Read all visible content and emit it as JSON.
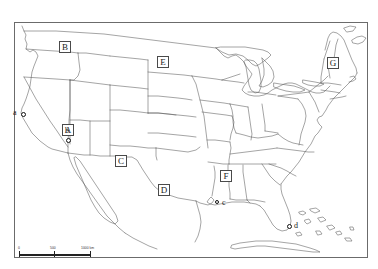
{
  "map": {
    "title": "Blank map of the contiguous United States",
    "projection_note": "United States political outline map with state boundaries",
    "background_color": "#ffffff",
    "outline_color": "#555555",
    "frame_color": "#6b6b6b"
  },
  "region_labels": [
    {
      "id": "A",
      "label": "A",
      "x": 62,
      "y": 124,
      "refers_to": "California"
    },
    {
      "id": "B",
      "label": "B",
      "x": 59,
      "y": 41,
      "refers_to": "Washington"
    },
    {
      "id": "C",
      "label": "C",
      "x": 115,
      "y": 155,
      "refers_to": "New Mexico"
    },
    {
      "id": "D",
      "label": "D",
      "x": 158,
      "y": 184,
      "refers_to": "Texas"
    },
    {
      "id": "E",
      "label": "E",
      "x": 157,
      "y": 56,
      "refers_to": "North Dakota"
    },
    {
      "id": "F",
      "label": "F",
      "x": 220,
      "y": 170,
      "refers_to": "Mississippi"
    },
    {
      "id": "G",
      "label": "G",
      "x": 327,
      "y": 57,
      "refers_to": "New Hampshire"
    }
  ],
  "city_markers": [
    {
      "id": "a",
      "label": "a",
      "dot_x": 21,
      "dot_y": 112,
      "label_x": 13,
      "label_y": 109,
      "style": "circle"
    },
    {
      "id": "b",
      "label": "b",
      "dot_x": 66,
      "dot_y": 138,
      "label_x": 65,
      "label_y": 127,
      "style": "circle"
    },
    {
      "id": "c",
      "label": "c",
      "dot_x": 214,
      "dot_y": 199,
      "label_x": 222,
      "label_y": 199,
      "style": "star"
    },
    {
      "id": "d",
      "label": "d",
      "dot_x": 287,
      "dot_y": 224,
      "label_x": 294,
      "label_y": 222,
      "style": "circle"
    }
  ],
  "scale_bar": {
    "labels": [
      "0",
      "500",
      "1000 km"
    ],
    "unit": "km",
    "max_value": 1000
  }
}
